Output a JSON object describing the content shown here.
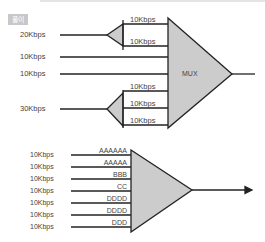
{
  "badge": "풀이",
  "upper": {
    "mux_label": "MUX",
    "inputs": [
      {
        "label": "20Kbps",
        "y": 35
      },
      {
        "label": "10Kbps",
        "y": 57
      },
      {
        "label": "10Kbps",
        "y": 74
      },
      {
        "label": "30Kbps",
        "y": 109
      }
    ],
    "split_labels": [
      "10Kbps",
      "10Kbps",
      "10Kbps",
      "10Kbps",
      "10Kbps"
    ]
  },
  "lower": {
    "inputs": [
      "10Kbps",
      "10Kbps",
      "10Kbps",
      "10Kbps",
      "10Kbps",
      "10Kbps",
      "10Kbps"
    ],
    "data_labels": [
      "AAAAAA",
      "AAAAA",
      "BBB",
      "CC",
      "DDDD",
      "DDDD",
      "DDD"
    ]
  },
  "colors": {
    "fill": "#cccccc",
    "stroke": "#222222"
  }
}
